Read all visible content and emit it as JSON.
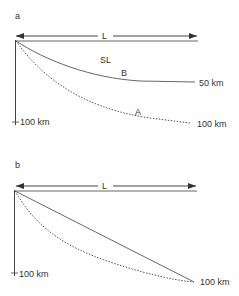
{
  "panels": [
    {
      "id": "a",
      "label": "a",
      "length_label": "L",
      "depth_label": "100 km",
      "surface_label": "SL",
      "curves": [
        {
          "name": "B",
          "label": "B",
          "style": "solid",
          "end_depth_label": "50 km"
        },
        {
          "name": "A",
          "label": "A",
          "style": "dotted",
          "end_depth_label": "100 km"
        }
      ]
    },
    {
      "id": "b",
      "label": "b",
      "length_label": "L",
      "depth_label": "100 km",
      "curves": [
        {
          "name": "straight",
          "style": "solid"
        },
        {
          "name": "curved",
          "style": "dotted"
        }
      ],
      "end_depth_label": "100 km"
    }
  ],
  "colors": {
    "line": "#555555",
    "text": "#333333",
    "background": "#ffffff"
  }
}
